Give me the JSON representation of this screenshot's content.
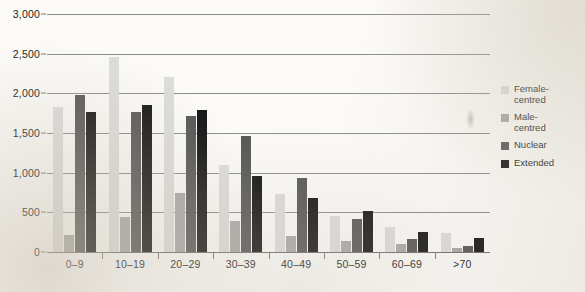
{
  "chart_data": {
    "type": "bar",
    "title": "",
    "subtitle": "",
    "xlabel": "",
    "ylabel": "",
    "grid": true,
    "legend_position": "right",
    "ylim": [
      0,
      3000
    ],
    "yticks": [
      0,
      500,
      1000,
      1500,
      2000,
      2500,
      3000
    ],
    "ytick_labels": [
      "0",
      "500",
      "1,000",
      "1,500",
      "2,000",
      "2,500",
      "3,000"
    ],
    "categories": [
      "0–9",
      "10–19",
      "20–29",
      "30–39",
      "40–49",
      "50–59",
      "60–69",
      ">70"
    ],
    "series": [
      {
        "name": "Female-\ncentred",
        "color": "#dcdcda",
        "values": [
          1830,
          2460,
          2210,
          1100,
          730,
          450,
          310,
          240
        ]
      },
      {
        "name": "Male-\ncentred",
        "color": "#a8a8a6",
        "values": [
          220,
          440,
          750,
          390,
          200,
          140,
          95,
          45
        ]
      },
      {
        "name": "Nuclear",
        "color": "#575757",
        "values": [
          1980,
          1760,
          1710,
          1460,
          930,
          410,
          165,
          75
        ]
      },
      {
        "name": "Extended",
        "color": "#161616",
        "values": [
          1760,
          1850,
          1790,
          960,
          680,
          520,
          250,
          180
        ]
      }
    ]
  }
}
